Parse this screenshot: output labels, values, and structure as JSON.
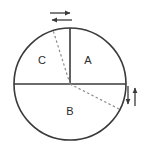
{
  "figure": {
    "type": "sector-diagram",
    "background_color": "#ffffff",
    "stroke_color": "#3a3a3a",
    "dashed_color": "#8a8a8a",
    "label_color": "#2b2b2b"
  },
  "circle": {
    "center_x": 70,
    "center_y": 84,
    "radius": 56,
    "stroke_width": 1.6
  },
  "sectors": [
    {
      "id": "A",
      "label": "A",
      "label_x": 88,
      "label_y": 61,
      "start_angle_deg": 0,
      "end_angle_deg": 90
    },
    {
      "id": "B",
      "label": "B",
      "label_x": 70,
      "label_y": 112,
      "start_angle_deg": 180,
      "end_angle_deg": 360
    },
    {
      "id": "C",
      "label": "C",
      "label_x": 42,
      "label_y": 61,
      "start_angle_deg": 90,
      "end_angle_deg": 180
    }
  ],
  "solid_radii": [
    {
      "name": "radius-up",
      "x1": 70,
      "y1": 84,
      "x2": 70,
      "y2": 28
    },
    {
      "name": "diameter-horizontal",
      "x1": 14,
      "y1": 84,
      "x2": 126,
      "y2": 84
    }
  ],
  "dashed_radii": [
    {
      "name": "dashed-radius-upper-left",
      "x1": 70,
      "y1": 84,
      "x2": 53,
      "y2": 30
    },
    {
      "name": "dashed-radius-lower-right",
      "x1": 70,
      "y1": 84,
      "x2": 119,
      "y2": 109
    }
  ],
  "arrows": {
    "top": {
      "name": "top-rotation-arrows",
      "orientation": "horizontal",
      "items": [
        {
          "name": "arrow-right",
          "direction": "right",
          "x1": 50,
          "y1": 13,
          "x2": 72,
          "y2": 13
        },
        {
          "name": "arrow-left",
          "direction": "left",
          "x1": 72,
          "y1": 20,
          "x2": 50,
          "y2": 20
        }
      ]
    },
    "right": {
      "name": "right-rotation-arrows",
      "orientation": "vertical",
      "items": [
        {
          "name": "arrow-down",
          "direction": "down",
          "x1": 128,
          "y1": 84,
          "x2": 128,
          "y2": 106
        },
        {
          "name": "arrow-up",
          "direction": "up",
          "x1": 135,
          "y1": 106,
          "x2": 135,
          "y2": 84
        }
      ]
    }
  }
}
